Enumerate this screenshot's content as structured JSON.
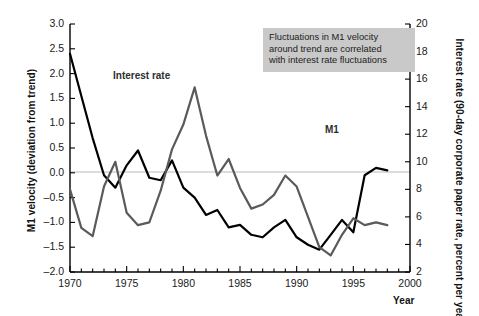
{
  "chart_data": {
    "type": "line",
    "title": "",
    "xlabel": "Year",
    "ylabel": "M1 velocity (deviation from trend)",
    "y2label": "Interest rate (90-day corporate paper rate, percent per year)",
    "xlim": [
      1970,
      2000
    ],
    "ylim": [
      -2.0,
      3.0
    ],
    "y2lim": [
      2,
      20
    ],
    "grid": false,
    "legend_position": "inline-labels",
    "x_major_ticks": [
      1970,
      1975,
      1980,
      1985,
      1990,
      1995,
      2000
    ],
    "x_minor_tick_step": 1,
    "y_left_ticks": [
      -2.0,
      -1.5,
      -1.0,
      -0.5,
      0.0,
      0.5,
      1.0,
      1.5,
      2.0,
      2.5,
      3.0
    ],
    "y_left_tick_labels": [
      "-2.0",
      "-1.5",
      "-1.0",
      "-0.5",
      "0.0",
      "0.5",
      "1.0",
      "1.5",
      "2.0",
      "2.5",
      "3.0"
    ],
    "y_right_ticks": [
      2,
      4,
      6,
      8,
      10,
      12,
      14,
      16,
      18,
      20
    ],
    "y_right_tick_labels": [
      "2",
      "4",
      "6",
      "8",
      "10",
      "12",
      "14",
      "16",
      "18",
      "20"
    ],
    "zero_line": 0.0,
    "x": [
      1970,
      1971,
      1972,
      1973,
      1974,
      1975,
      1976,
      1977,
      1978,
      1979,
      1980,
      1981,
      1982,
      1983,
      1984,
      1985,
      1986,
      1987,
      1988,
      1989,
      1990,
      1991,
      1992,
      1993,
      1994,
      1995,
      1996,
      1997,
      1998
    ],
    "series": [
      {
        "name": "M1",
        "axis": "left",
        "color": "#000000",
        "values": [
          2.4,
          1.55,
          0.7,
          -0.05,
          -0.3,
          0.15,
          0.45,
          -0.1,
          -0.15,
          0.25,
          -0.3,
          -0.5,
          -0.85,
          -0.75,
          -1.1,
          -1.05,
          -1.25,
          -1.3,
          -1.1,
          -0.95,
          -1.3,
          -1.45,
          -1.55,
          -1.25,
          -0.95,
          -1.2,
          -0.05,
          0.1,
          0.05
        ]
      },
      {
        "name": "Interest rate",
        "axis": "right",
        "color": "#5a5a5a",
        "values": [
          8.0,
          5.2,
          4.6,
          8.2,
          10.0,
          6.3,
          5.4,
          5.6,
          7.9,
          10.9,
          12.7,
          15.4,
          11.9,
          9.0,
          10.2,
          8.1,
          6.6,
          6.9,
          7.6,
          9.0,
          8.2,
          6.0,
          3.8,
          3.2,
          4.7,
          5.9,
          5.4,
          5.6,
          5.4
        ]
      }
    ],
    "annotation": {
      "lines": [
        "Fluctuations in M1 velocity",
        "around trend are correlated",
        "with interest rate fluctuations"
      ],
      "background_color": "#c9c9c9"
    },
    "inline_labels": [
      {
        "text": "Interest rate",
        "series": "Interest rate"
      },
      {
        "text": "M1",
        "series": "M1"
      }
    ]
  }
}
